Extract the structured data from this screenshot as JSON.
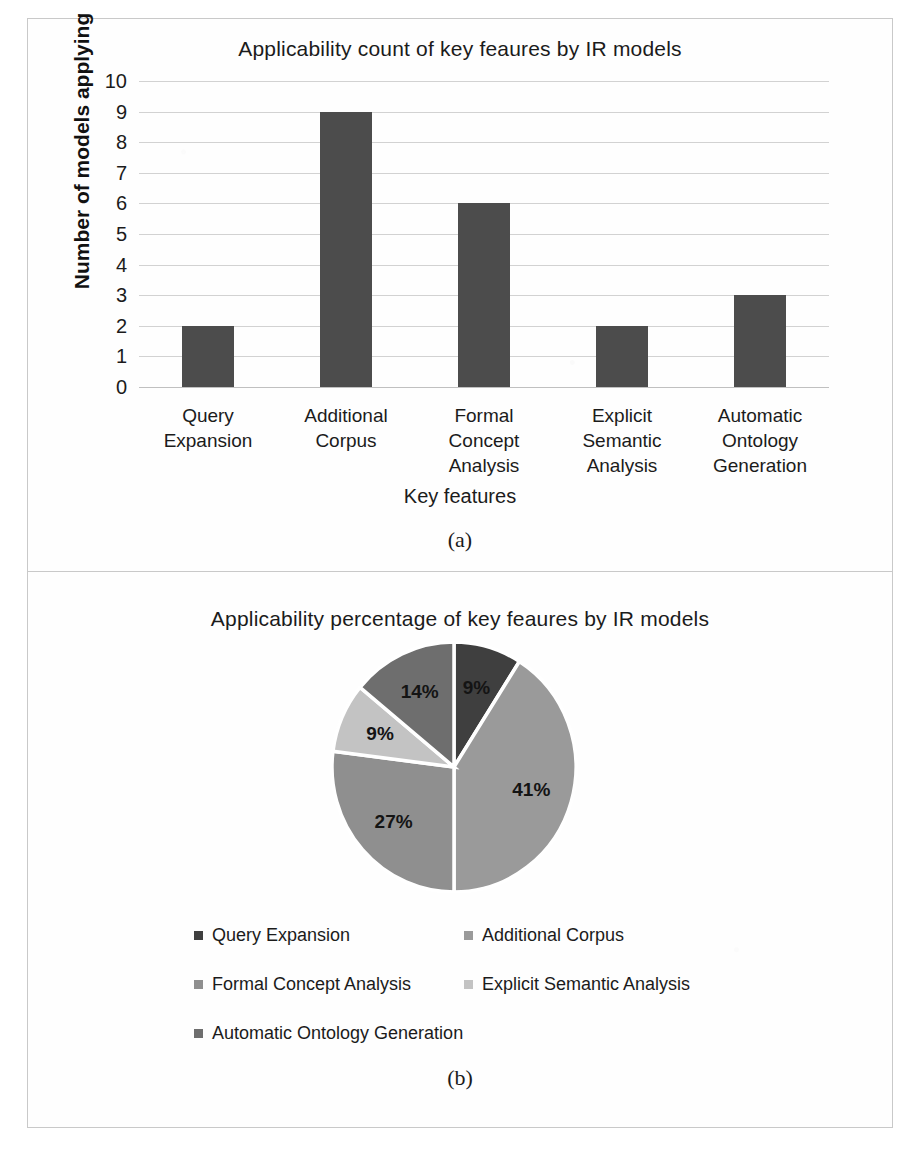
{
  "figure": {
    "panel_a_label": "(a)",
    "panel_b_label": "(b)"
  },
  "chart_data": [
    {
      "type": "bar",
      "title": "Applicability  count of key feaures by IR models",
      "xlabel": "Key features",
      "ylabel": "Number of models applying",
      "categories": [
        "Query Expansion",
        "Additional Corpus",
        "Formal Concept Analysis",
        "Explicit Semantic Analysis",
        "Automatic Ontology Generation"
      ],
      "category_lines": [
        [
          "Query",
          "Expansion"
        ],
        [
          "Additional",
          "Corpus"
        ],
        [
          "Formal",
          "Concept",
          "Analysis"
        ],
        [
          "Explicit",
          "Semantic",
          "Analysis"
        ],
        [
          "Automatic",
          "Ontology",
          "Generation"
        ]
      ],
      "values": [
        2,
        9,
        6,
        2,
        3
      ],
      "ylim": [
        0,
        10
      ],
      "yticks": [
        10,
        9,
        8,
        7,
        6,
        5,
        4,
        3,
        2,
        1,
        0
      ],
      "grid": true,
      "legend": "none",
      "bar_color": "#4c4c4c"
    },
    {
      "type": "pie",
      "title": "Applicability  percentage of key feaures by IR models",
      "labels": [
        "Query Expansion",
        "Additional Corpus",
        "Formal Concept Analysis",
        "Explicit Semantic Analysis",
        "Automatic Ontology Generation"
      ],
      "values": [
        9,
        41,
        27,
        9,
        14
      ],
      "value_labels": [
        "9%",
        "41%",
        "27%",
        "9%",
        "14%"
      ],
      "colors": [
        "#3f3f3f",
        "#9a9a9a",
        "#8f8f8f",
        "#c3c3c3",
        "#6e6e6e"
      ],
      "legend_position": "bottom",
      "start_angle_deg": 0,
      "direction": "clockwise"
    }
  ]
}
